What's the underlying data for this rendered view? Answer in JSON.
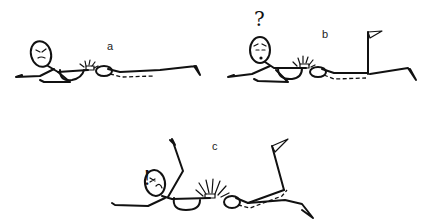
{
  "figure": {
    "panels": [
      {
        "id": "a",
        "label": "a",
        "face": "angry",
        "mark": ""
      },
      {
        "id": "b",
        "label": "b",
        "face": "worried",
        "mark": "?"
      },
      {
        "id": "c",
        "label": "c",
        "face": "pained",
        "mark": "!"
      }
    ],
    "colors": {
      "line": "#111111",
      "background": "#ffffff"
    }
  }
}
